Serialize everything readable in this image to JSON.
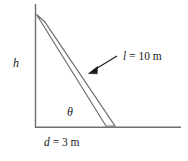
{
  "figure": {
    "stroke_color": "#6e6e6e",
    "arrow_color": "#1a1a1a",
    "text_color": "#1a1a1a",
    "background": "#ffffff"
  },
  "labels": {
    "height": "h",
    "angle": "θ",
    "length_var": "l",
    "length_eq": " = 10 m",
    "length_full": "l = 10 m",
    "distance_var": "d",
    "distance_eq": " = 3 m",
    "distance_full": "d = 3 m"
  },
  "geometry": {
    "wall_x": 35,
    "wall_top_y": 4,
    "ground_y": 127,
    "ground_right_x": 181,
    "rod_top": [
      40,
      18
    ],
    "rod_bottom": [
      110,
      124
    ],
    "rod_width": 8,
    "arrow_tail": [
      116,
      57
    ],
    "arrow_head": [
      89,
      73
    ]
  },
  "values": {
    "ladder_length": "10 m",
    "base_distance": "3 m"
  }
}
